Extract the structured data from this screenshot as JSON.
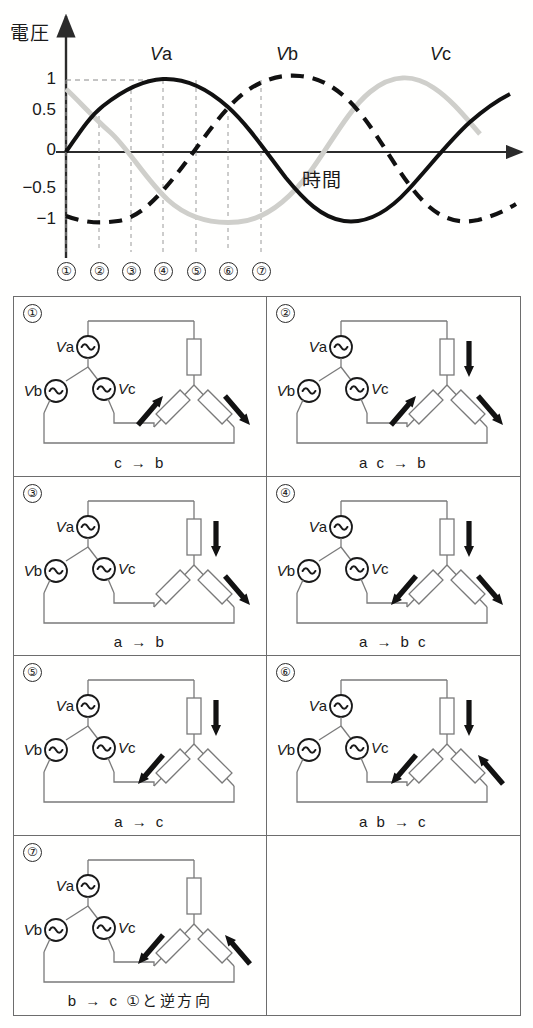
{
  "chart_data": {
    "type": "line",
    "title": "",
    "ylabel": "電圧",
    "xlabel": "時間",
    "ylim": [
      -1.3,
      1.15
    ],
    "yticks": [
      "1",
      "0.5",
      "0",
      "−0.5",
      "−1"
    ],
    "ytick_values": [
      1,
      0.5,
      0,
      -0.5,
      -1
    ],
    "grid": false,
    "legend_position": "inline-above-curves",
    "series": [
      {
        "name": "Va",
        "style": "solid-black",
        "phase_deg": 0,
        "amplitude": 1
      },
      {
        "name": "Vb",
        "style": "dashed-black",
        "phase_deg": -120,
        "amplitude": 1
      },
      {
        "name": "Vc",
        "style": "solid-gray",
        "phase_deg": 120,
        "amplitude": 1
      }
    ],
    "markers": [
      "①",
      "②",
      "③",
      "④",
      "⑤",
      "⑥",
      "⑦"
    ],
    "marker_phase_deg": [
      0,
      30,
      60,
      90,
      120,
      150,
      180
    ],
    "annotations": [
      {
        "text": "Va",
        "series": "Va"
      },
      {
        "text": "Vb",
        "series": "Vb"
      },
      {
        "text": "Vc",
        "series": "Vc"
      },
      {
        "text": "時間",
        "kind": "x-axis-label"
      },
      {
        "text": "電圧",
        "kind": "y-axis-label"
      }
    ]
  },
  "chart": {
    "y_axis_label": "電圧",
    "x_axis_label": "時間",
    "yticks": [
      "1",
      "0.5",
      "0",
      "−0.5",
      "−1"
    ],
    "curve_labels": [
      {
        "v": "V",
        "sub": "a"
      },
      {
        "v": "V",
        "sub": "b"
      },
      {
        "v": "V",
        "sub": "c"
      }
    ],
    "markers": [
      "①",
      "②",
      "③",
      "④",
      "⑤",
      "⑥",
      "⑦"
    ]
  },
  "source_labels": {
    "a": "Va",
    "b": "Vb",
    "c": "Vc",
    "v": "V",
    "a_sub": "a",
    "b_sub": "b",
    "c_sub": "c"
  },
  "panels": [
    {
      "num": "①",
      "caption": "c  →  b",
      "arrows": {
        "top": "none",
        "left": "up",
        "right": "down"
      }
    },
    {
      "num": "②",
      "caption": "a c  →  b",
      "arrows": {
        "top": "down",
        "left": "up",
        "right": "down"
      }
    },
    {
      "num": "③",
      "caption": "a  →  b",
      "arrows": {
        "top": "down",
        "left": "none",
        "right": "down"
      }
    },
    {
      "num": "④",
      "caption": "a  →  b c",
      "arrows": {
        "top": "down",
        "left": "down",
        "right": "down"
      }
    },
    {
      "num": "⑤",
      "caption": "a  →  c",
      "arrows": {
        "top": "down",
        "left": "down",
        "right": "none"
      }
    },
    {
      "num": "⑥",
      "caption": "a b  →  c",
      "arrows": {
        "top": "down",
        "left": "down",
        "right": "up"
      }
    },
    {
      "num": "⑦",
      "caption": "b  →  c ①と逆方向",
      "arrows": {
        "top": "none",
        "left": "down",
        "right": "up"
      }
    }
  ],
  "colors": {
    "ink": "#1a1a1a",
    "wire": "#7a7a7a",
    "curve_va": "#111111",
    "curve_vb": "#111111",
    "curve_vc": "#cfcfcb",
    "panel_border": "#6d6d6d",
    "background": "#fffffe"
  }
}
